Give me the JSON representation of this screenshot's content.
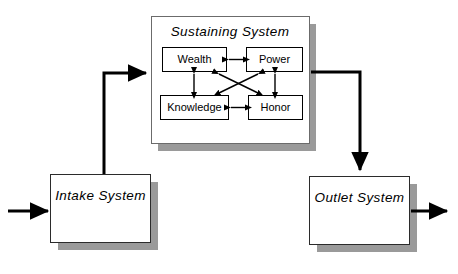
{
  "diagram": {
    "title": "Sustaining System",
    "background_color": "#ffffff",
    "shadow_color": "#9a9a9a",
    "line_color": "#000000",
    "systems": {
      "sustaining": {
        "label": "Sustaining System",
        "style": "italic"
      },
      "intake": {
        "label": "Intake System",
        "style": "italic"
      },
      "outlet": {
        "label": "Outlet System",
        "style": "italic"
      }
    },
    "nodes": [
      {
        "id": "wealth",
        "label": "Wealth"
      },
      {
        "id": "power",
        "label": "Power"
      },
      {
        "id": "knowledge",
        "label": "Knowledge"
      },
      {
        "id": "honor",
        "label": "Honor"
      }
    ],
    "connections": [
      {
        "from": "wealth",
        "to": "power",
        "type": "bidirectional"
      },
      {
        "from": "knowledge",
        "to": "honor",
        "type": "bidirectional"
      },
      {
        "from": "wealth",
        "to": "knowledge",
        "type": "bidirectional"
      },
      {
        "from": "power",
        "to": "honor",
        "type": "bidirectional"
      },
      {
        "from": "wealth",
        "to": "honor",
        "type": "bidirectional"
      },
      {
        "from": "power",
        "to": "knowledge",
        "type": "bidirectional"
      },
      {
        "from": "intake",
        "to": "sustaining",
        "type": "directional"
      },
      {
        "from": "sustaining",
        "to": "outlet",
        "type": "directional"
      },
      {
        "from": "input",
        "to": "intake",
        "type": "directional"
      },
      {
        "from": "outlet",
        "to": "output",
        "type": "directional"
      }
    ]
  }
}
